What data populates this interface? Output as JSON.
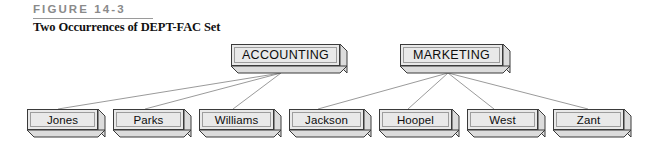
{
  "figure": {
    "label": "FIGURE 14-3",
    "caption": "Two Occurrences of DEPT-FAC Set"
  },
  "colors": {
    "box_face": "#e9e9e9",
    "box_side": "#dcdcdc",
    "box_outline": "#3a3a3a",
    "connector": "#8e8e8e",
    "label_text": "#8a8a8a",
    "caption_text": "#111111"
  },
  "chart_data": {
    "type": "diagram",
    "diagram_kind": "network-set-occurrence",
    "title": "Two Occurrences of DEPT-FAC Set",
    "owners": [
      {
        "id": "accounting",
        "label": "ACCOUNTING",
        "members": [
          "Jones",
          "Parks",
          "Williams"
        ]
      },
      {
        "id": "marketing",
        "label": "MARKETING",
        "members": [
          "Jackson",
          "Hoopel",
          "West",
          "Zant"
        ]
      }
    ]
  },
  "nodes": {
    "parents": [
      {
        "label": "ACCOUNTING",
        "x": 231,
        "y": 44,
        "w": 116,
        "h": 29
      },
      {
        "label": "MARKETING",
        "x": 400,
        "y": 44,
        "w": 110,
        "h": 29
      }
    ],
    "leaves": [
      {
        "label": "Jones",
        "x": 27,
        "y": 109,
        "w": 78,
        "h": 28
      },
      {
        "label": "Parks",
        "x": 113,
        "y": 109,
        "w": 78,
        "h": 28
      },
      {
        "label": "Williams",
        "x": 199,
        "y": 109,
        "w": 82,
        "h": 28
      },
      {
        "label": "Jackson",
        "x": 289,
        "y": 109,
        "w": 82,
        "h": 28
      },
      {
        "label": "Hoopel",
        "x": 379,
        "y": 109,
        "w": 80,
        "h": 28
      },
      {
        "label": "West",
        "x": 467,
        "y": 109,
        "w": 78,
        "h": 28
      },
      {
        "label": "Zant",
        "x": 553,
        "y": 109,
        "w": 78,
        "h": 28
      }
    ]
  },
  "connectors": [
    {
      "from": "accounting",
      "to": "Jones",
      "x1": 281,
      "y1": 73,
      "x2": 58,
      "y2": 109
    },
    {
      "from": "accounting",
      "to": "Parks",
      "x1": 281,
      "y1": 73,
      "x2": 145,
      "y2": 109
    },
    {
      "from": "accounting",
      "to": "Williams",
      "x1": 281,
      "y1": 73,
      "x2": 233,
      "y2": 109
    },
    {
      "from": "marketing",
      "to": "Jackson",
      "x1": 448,
      "y1": 73,
      "x2": 318,
      "y2": 109
    },
    {
      "from": "marketing",
      "to": "Hoopel",
      "x1": 448,
      "y1": 73,
      "x2": 408,
      "y2": 109
    },
    {
      "from": "marketing",
      "to": "West",
      "x1": 448,
      "y1": 73,
      "x2": 494,
      "y2": 109
    },
    {
      "from": "marketing",
      "to": "Zant",
      "x1": 448,
      "y1": 73,
      "x2": 588,
      "y2": 109
    }
  ]
}
